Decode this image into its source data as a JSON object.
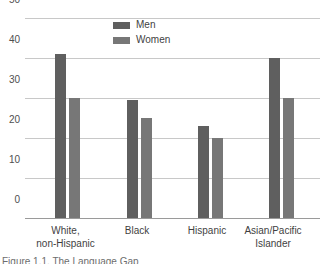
{
  "chart_data": {
    "type": "bar",
    "title": "",
    "xlabel": "",
    "ylabel": "",
    "ylim": [
      0,
      50
    ],
    "yticks": [
      "0",
      "10",
      "20",
      "30",
      "40",
      "50"
    ],
    "grid": true,
    "legend_position": "top-center",
    "categories": [
      "White,\nnon-Hispanic",
      "Black",
      "Hispanic",
      "Asian/Pacific\nIslander"
    ],
    "series": [
      {
        "name": "Men",
        "color": "#5f5f5f",
        "values": [
          41,
          29.5,
          23,
          40
        ]
      },
      {
        "name": "Women",
        "color": "#777777",
        "values": [
          30,
          25,
          20,
          30
        ]
      }
    ]
  },
  "caption": {
    "text": "Figure 1.1. The Language Gap"
  }
}
